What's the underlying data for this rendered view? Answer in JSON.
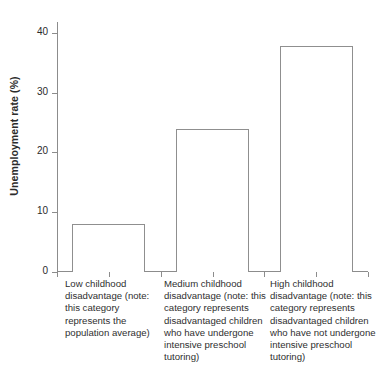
{
  "chart_data": {
    "type": "bar",
    "title": "",
    "xlabel": "",
    "ylabel": "Unemployment rate (%)",
    "ylim": [
      0,
      42
    ],
    "yticks": [
      0,
      10,
      20,
      30,
      40
    ],
    "ytick_labels": [
      "0",
      "10",
      "20",
      "30",
      "40"
    ],
    "grid": false,
    "legend": null,
    "categories": [
      "Low childhood disadvantage (note: this category represents the population average)",
      "Medium childhood disadvantage (note: this category represents disadvantaged children who have undergone intensive preschool tutoring)",
      "High childhood disadvantage (note: this category represents disadvantaged children who have not undergone intensive preschool tutoring)"
    ],
    "values": [
      8,
      24,
      38
    ],
    "bar_style": {
      "fill": "#ffffff",
      "edge": "#8f8f8f"
    }
  },
  "axes": {
    "y_title": "Unemployment rate (%)",
    "y_ticks": [
      {
        "value": 40,
        "label": "40"
      },
      {
        "value": 30,
        "label": "30"
      },
      {
        "value": 20,
        "label": "20"
      },
      {
        "value": 10,
        "label": "10"
      },
      {
        "value": 0,
        "label": "0"
      }
    ],
    "axis_color": "#8c8c8c"
  },
  "bars": [
    {
      "label": "Low childhood disadvantage (note: this category represents the population average)",
      "value": 8
    },
    {
      "label": "Medium childhood disadvantage (note: this category represents disadvantaged children who have undergone intensive preschool tutoring)",
      "value": 24
    },
    {
      "label": "High childhood disadvantage (note: this category represents disadvantaged children who have not undergone intensive preschool tutoring)",
      "value": 38
    }
  ],
  "colors": {
    "background": "#ffffff",
    "axis": "#8c8c8c",
    "bar_edge": "#8f8f8f",
    "bar_fill": "#ffffff",
    "text": "#2f2f2f"
  }
}
